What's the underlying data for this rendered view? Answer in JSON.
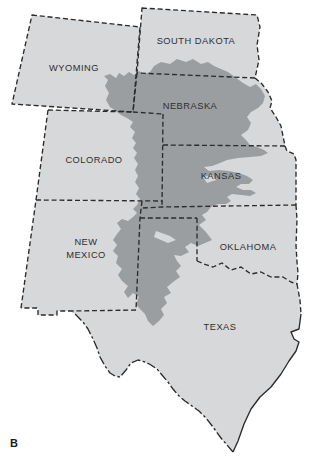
{
  "figure": {
    "panel_label": "B",
    "colors": {
      "background": "#ffffff",
      "state_fill": "#d7d8d9",
      "aquifer_fill": "#9b9ea1",
      "border": "#2b2b2b",
      "label_text": "#2e2e2e"
    },
    "map": {
      "states": [
        {
          "id": "wyoming",
          "label": "WYOMING"
        },
        {
          "id": "south-dakota",
          "label": "SOUTH DAKOTA"
        },
        {
          "id": "nebraska",
          "label": "NEBRASKA"
        },
        {
          "id": "colorado",
          "label": "COLORADO"
        },
        {
          "id": "kansas",
          "label": "KANSAS"
        },
        {
          "id": "new-mexico",
          "label": "NEW",
          "label2": "MEXICO"
        },
        {
          "id": "oklahoma",
          "label": "OKLAHOMA"
        },
        {
          "id": "texas",
          "label": "TEXAS"
        }
      ]
    }
  }
}
